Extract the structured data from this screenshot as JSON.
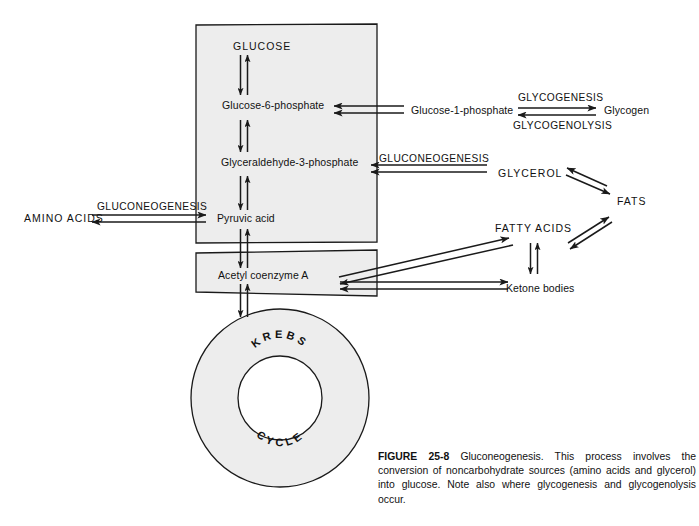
{
  "figure": {
    "number": "FIGURE 25-8",
    "title": "Gluconeogenesis.",
    "caption_body": "This process involves the conversion of noncarbohydrate sources (amino acids and glycerol) into glucose. Note also where glycogenesis and glycogenolysis occur.",
    "caption_full": "FIGURE 25-8 Gluconeogenesis. This process involves the conversion of noncarbohydrate sources (amino acids and glycerol) into glucose. Note also where glycogenesis and glycogenolysis occur."
  },
  "colors": {
    "background": "#ffffff",
    "panel_fill": "#ededed",
    "stroke": "#1a1a1a",
    "text": "#111111"
  },
  "metabolites": {
    "glucose": "GLUCOSE",
    "glucose_6_phosphate": "Glucose-6-phosphate",
    "glyceraldehyde_3_phosphate": "Glyceraldehyde-3-phosphate",
    "pyruvic_acid": "Pyruvic acid",
    "acetyl_coenzyme_a": "Acetyl coenzyme A",
    "glucose_1_phosphate": "Glucose-1-phosphate",
    "glycogen": "Glycogen",
    "glycerol": "GLYCEROL",
    "fats": "FATS",
    "fatty_acids": "FATTY ACIDS",
    "ketone_bodies": "Ketone bodies",
    "amino_acids": "AMINO ACIDS"
  },
  "processes": {
    "glycogenesis": "GLYCOGENESIS",
    "glycogenolysis": "GLYCOGENOLYSIS",
    "gluconeogenesis_glycerol": "GLUCONEOGENESIS",
    "gluconeogenesis_amino": "GLUCONEOGENESIS"
  },
  "krebs_cycle": {
    "line1": "KREBS",
    "line2": "CYCLE",
    "letters_top": [
      "K",
      "R",
      "E",
      "B",
      "S"
    ],
    "letters_bottom": [
      "C",
      "Y",
      "C",
      "L",
      "E"
    ]
  },
  "panels": {
    "glycolysis_panel_label": "glycolysis-pathway-panel",
    "acetyl_panel_label": "acetyl-coa-panel"
  }
}
